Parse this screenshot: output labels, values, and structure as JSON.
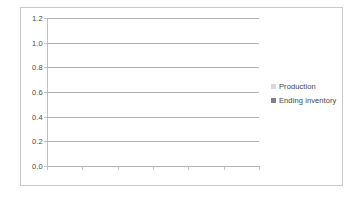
{
  "chart_data": {
    "type": "bar",
    "title": "",
    "subtitle": "",
    "xlabel": "",
    "ylabel": "",
    "categories": [],
    "series": [
      {
        "name": "Production",
        "values": [],
        "color": "#d9d9d9"
      },
      {
        "name": "Ending inventory",
        "values": [],
        "color": "#808080"
      }
    ],
    "ylim": [
      0.0,
      1.2
    ],
    "y_ticks": [
      "0.0",
      "0.2",
      "0.4",
      "0.6",
      "0.8",
      "1.0",
      "1.2"
    ],
    "y_tick_values": [
      0.0,
      0.2,
      0.4,
      0.6,
      0.8,
      1.0,
      1.2
    ],
    "x_tick_labels": [
      "",
      "",
      "",
      "",
      "",
      "",
      ""
    ],
    "x_tick_count": 7,
    "grid": true,
    "gridline_color": "#b3b3b3",
    "axis_color": "#c0c0c0",
    "border_color": "#c9c9c9",
    "plot_background": "#ffffff",
    "legend_position": "right",
    "note": "Empty plot area - no data series rendered"
  },
  "legend": {
    "items": [
      {
        "label": "Production",
        "color": "#d9d9d9"
      },
      {
        "label": "Ending inventory",
        "color": "#808080"
      }
    ]
  },
  "axes": {
    "y": {
      "ticks": [
        {
          "label": "1.2",
          "value": 1.2
        },
        {
          "label": "1.0",
          "value": 1.0
        },
        {
          "label": "0.8",
          "value": 0.8
        },
        {
          "label": "0.6",
          "value": 0.6
        },
        {
          "label": "0.4",
          "value": 0.4
        },
        {
          "label": "0.2",
          "value": 0.2
        },
        {
          "label": "0.0",
          "value": 0.0
        }
      ]
    }
  }
}
